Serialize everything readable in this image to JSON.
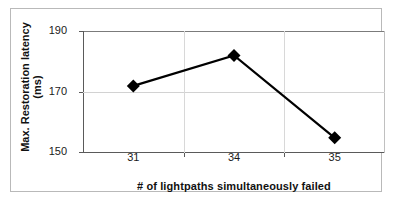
{
  "chart_data": {
    "type": "line",
    "title": "",
    "xlabel": "# of lightpaths simultaneously failed",
    "ylabel_line1": "Max. Restoration latency",
    "ylabel_line2": "(ms)",
    "categories": [
      "31",
      "34",
      "35"
    ],
    "x": [
      31,
      34,
      35
    ],
    "values": [
      172,
      182,
      155
    ],
    "series": [
      {
        "name": "Max. Restoration latency (ms)",
        "values": [
          172,
          182,
          155
        ]
      }
    ],
    "ylim": [
      150,
      190
    ],
    "yticks": [
      "150",
      "170",
      "190"
    ],
    "ytick_values": [
      150,
      170,
      190
    ],
    "xticks": [
      "31",
      "34",
      "35"
    ],
    "grid": "horizontal-only",
    "legend": "none",
    "marker": "diamond",
    "line_color": "#000000",
    "marker_color": "#000000",
    "gridline_color": "#d2d2d2",
    "axis_color": "#5a5a5a",
    "frame_color": "#b9b9b9",
    "background_color": "#ffffff"
  }
}
